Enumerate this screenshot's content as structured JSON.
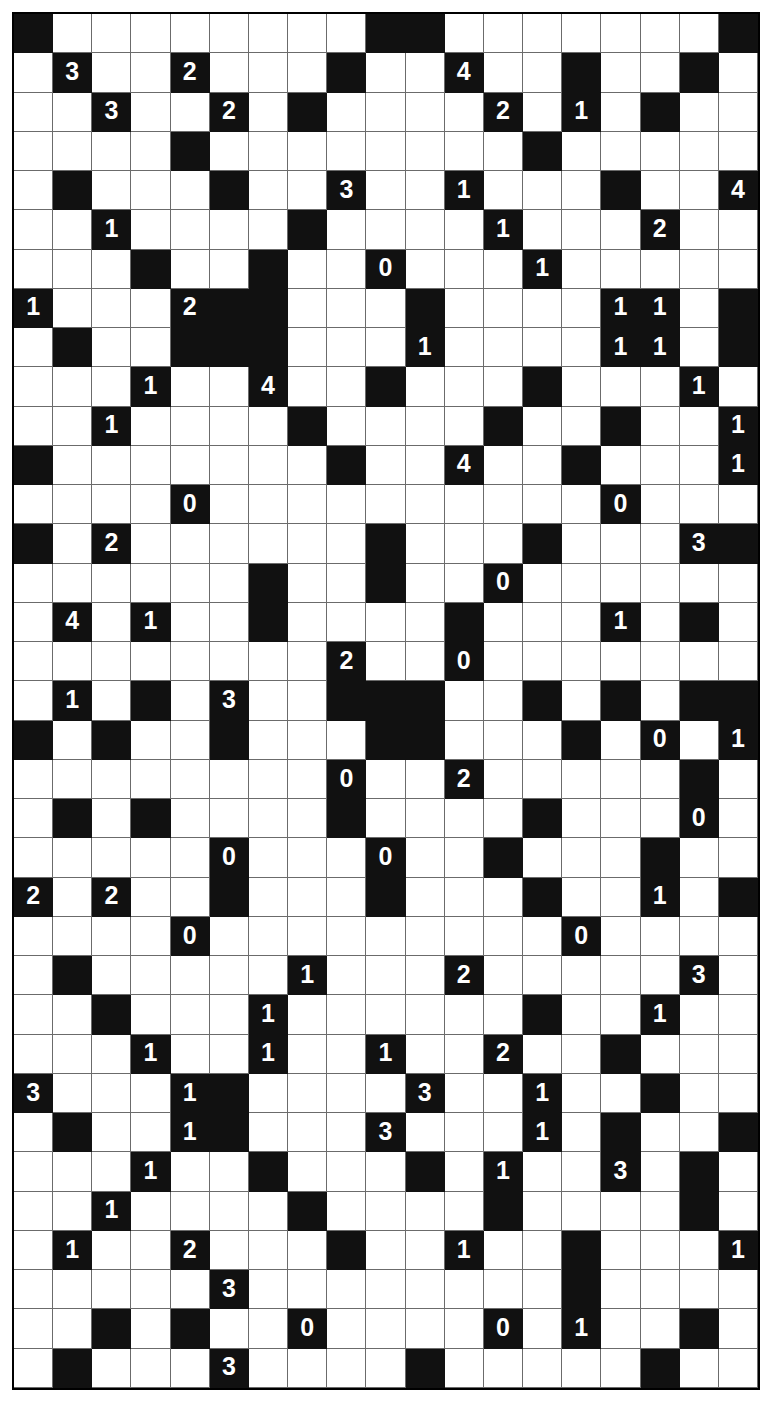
{
  "puzzle": {
    "title": "Logic Number Grid Puzzle",
    "type": "black-and-white-number-grid",
    "columns": 19,
    "rows": 35,
    "colors": {
      "filled_cell": "#111111",
      "empty_cell": "#ffffff",
      "gridline": "#6b6b6b",
      "border": "#000000",
      "filled_text": "#ffffff",
      "empty_text": "#000000"
    },
    "legend": {
      "filled_description": "Shaded (black) square",
      "empty_description": "Unshaded (white) square",
      "clue_description": "Digit printed in white on a shaded square"
    },
    "clue_values": [
      "0",
      "1",
      "2",
      "3",
      "4"
    ],
    "counts": {
      "total_cells": 665,
      "clue_count": 75
    },
    "grid": [
      {
        "row": 0,
        "black": [
          0,
          9,
          10,
          18
        ],
        "clues": {}
      },
      {
        "row": 1,
        "black": [
          1,
          4,
          8,
          11,
          14,
          17
        ],
        "clues": {
          "1": "3",
          "4": "2",
          "11": "4"
        }
      },
      {
        "row": 2,
        "black": [
          2,
          5,
          7,
          12,
          14,
          16
        ],
        "clues": {
          "2": "3",
          "5": "2",
          "12": "2",
          "14": "1"
        }
      },
      {
        "row": 3,
        "black": [
          4,
          13
        ],
        "clues": {}
      },
      {
        "row": 4,
        "black": [
          1,
          5,
          8,
          11,
          15,
          18
        ],
        "clues": {
          "8": "3",
          "11": "1",
          "18": "4"
        }
      },
      {
        "row": 5,
        "black": [
          2,
          7,
          12,
          16
        ],
        "clues": {
          "2": "1",
          "12": "1",
          "16": "2"
        }
      },
      {
        "row": 6,
        "black": [
          3,
          6,
          9,
          13
        ],
        "clues": {
          "9": "0",
          "13": "1"
        }
      },
      {
        "row": 7,
        "black": [
          0,
          4,
          5,
          6,
          10,
          15,
          16,
          18
        ],
        "clues": {
          "0": "1",
          "4": "2",
          "15": "1",
          "16": "1"
        }
      },
      {
        "row": 8,
        "black": [
          1,
          4,
          5,
          6,
          10,
          15,
          16,
          18
        ],
        "clues": {
          "10": "1",
          "15": "1",
          "16": "1"
        }
      },
      {
        "row": 9,
        "black": [
          3,
          6,
          9,
          13,
          17
        ],
        "clues": {
          "3": "1",
          "6": "4",
          "17": "1"
        }
      },
      {
        "row": 10,
        "black": [
          2,
          7,
          12,
          15,
          18
        ],
        "clues": {
          "2": "1",
          "18": "1"
        }
      },
      {
        "row": 11,
        "black": [
          0,
          8,
          11,
          14,
          18
        ],
        "clues": {
          "11": "4",
          "18": "1"
        }
      },
      {
        "row": 12,
        "black": [
          4,
          15
        ],
        "clues": {
          "4": "0",
          "15": "0"
        }
      },
      {
        "row": 13,
        "black": [
          0,
          2,
          9,
          13,
          17,
          18
        ],
        "clues": {
          "2": "2",
          "17": "3"
        }
      },
      {
        "row": 14,
        "black": [
          6,
          9,
          12
        ],
        "clues": {
          "12": "0"
        }
      },
      {
        "row": 15,
        "black": [
          1,
          3,
          6,
          11,
          15,
          17
        ],
        "clues": {
          "1": "4",
          "3": "1",
          "15": "1"
        }
      },
      {
        "row": 16,
        "black": [
          8,
          11
        ],
        "clues": {
          "8": "2",
          "11": "0"
        }
      },
      {
        "row": 17,
        "black": [
          1,
          3,
          5,
          8,
          9,
          10,
          13,
          15,
          17,
          18
        ],
        "clues": {
          "1": "1",
          "5": "3"
        }
      },
      {
        "row": 18,
        "black": [
          0,
          2,
          5,
          9,
          10,
          14,
          16,
          18
        ],
        "clues": {
          "16": "0",
          "18": "1"
        }
      },
      {
        "row": 19,
        "black": [
          8,
          11,
          17
        ],
        "clues": {
          "8": "0",
          "11": "2"
        }
      },
      {
        "row": 20,
        "black": [
          1,
          3,
          8,
          13,
          17
        ],
        "clues": {
          "17": "0"
        }
      },
      {
        "row": 21,
        "black": [
          5,
          9,
          12,
          16
        ],
        "clues": {
          "5": "0",
          "9": "0"
        }
      },
      {
        "row": 22,
        "black": [
          0,
          2,
          5,
          9,
          13,
          16,
          18
        ],
        "clues": {
          "0": "2",
          "2": "2",
          "16": "1"
        }
      },
      {
        "row": 23,
        "black": [
          4,
          14
        ],
        "clues": {
          "4": "0",
          "14": "0"
        }
      },
      {
        "row": 24,
        "black": [
          1,
          7,
          11,
          17
        ],
        "clues": {
          "7": "1",
          "11": "2",
          "17": "3"
        }
      },
      {
        "row": 25,
        "black": [
          2,
          6,
          13,
          16
        ],
        "clues": {
          "6": "1",
          "16": "1"
        }
      },
      {
        "row": 26,
        "black": [
          3,
          6,
          9,
          12,
          15
        ],
        "clues": {
          "3": "1",
          "6": "1",
          "9": "1",
          "12": "2"
        }
      },
      {
        "row": 27,
        "black": [
          0,
          4,
          5,
          10,
          13,
          16
        ],
        "clues": {
          "0": "3",
          "4": "1",
          "10": "3",
          "13": "1"
        }
      },
      {
        "row": 28,
        "black": [
          1,
          4,
          5,
          9,
          13,
          15,
          18
        ],
        "clues": {
          "4": "1",
          "9": "3",
          "13": "1"
        }
      },
      {
        "row": 29,
        "black": [
          3,
          6,
          10,
          12,
          15,
          17
        ],
        "clues": {
          "3": "1",
          "12": "1",
          "15": "3"
        }
      },
      {
        "row": 30,
        "black": [
          2,
          7,
          12,
          17
        ],
        "clues": {
          "2": "1"
        }
      },
      {
        "row": 31,
        "black": [
          1,
          4,
          8,
          11,
          14,
          18
        ],
        "clues": {
          "1": "1",
          "4": "2",
          "11": "1",
          "18": "1"
        }
      },
      {
        "row": 32,
        "black": [
          5,
          14
        ],
        "clues": {
          "5": "3"
        }
      },
      {
        "row": 33,
        "black": [
          2,
          4,
          7,
          12,
          14,
          17
        ],
        "clues": {
          "7": "0",
          "12": "0",
          "14": "1"
        }
      },
      {
        "row": 34,
        "black": [
          1,
          5,
          10,
          16
        ],
        "clues": {
          "5": "3"
        }
      },
      {
        "row": 35,
        "black": [
          0,
          9,
          18
        ],
        "clues": {
          "9": "2",
          "18": "2"
        }
      }
    ]
  }
}
